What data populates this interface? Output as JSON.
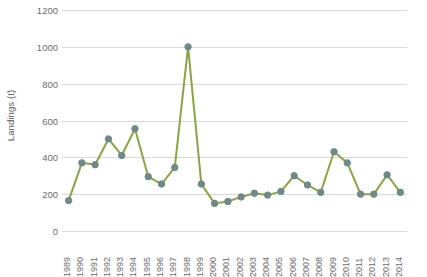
{
  "chart_data": {
    "type": "line",
    "title": "",
    "xlabel": "",
    "ylabel": "Landings (t)",
    "ylim": [
      0,
      1200
    ],
    "ytick_step": 200,
    "yticks": [
      "0",
      "200",
      "400",
      "600",
      "800",
      "1000",
      "1200"
    ],
    "grid": true,
    "legend": "none",
    "markers": true,
    "line_color": "#8ba544",
    "marker_color": "#6d8a88",
    "marker_edge_color": "#6d8a88",
    "gridline_color": "#d9d9d9",
    "background_color": "#ffffff",
    "tick_label_color": "#6b6b6b",
    "categories": [
      "1989",
      "1990",
      "1991",
      "1992",
      "1993",
      "1994",
      "1995",
      "1996",
      "1997",
      "1998",
      "1999",
      "2000",
      "2001",
      "2002",
      "2003",
      "2004",
      "2005",
      "2006",
      "2007",
      "2008",
      "2009",
      "2010",
      "2011",
      "2012",
      "2013",
      "2014"
    ],
    "values": [
      165,
      370,
      360,
      500,
      410,
      555,
      295,
      255,
      345,
      1000,
      255,
      150,
      160,
      185,
      205,
      195,
      215,
      300,
      250,
      210,
      430,
      370,
      200,
      200,
      305,
      210
    ],
    "series": [
      {
        "name": "Landings",
        "values": [
          165,
          370,
          360,
          500,
          410,
          555,
          295,
          255,
          345,
          1000,
          255,
          150,
          160,
          185,
          205,
          195,
          215,
          300,
          250,
          210,
          430,
          370,
          200,
          200,
          305,
          210
        ]
      }
    ]
  }
}
